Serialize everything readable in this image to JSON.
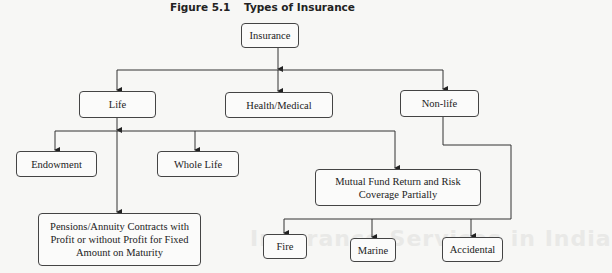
{
  "figure": {
    "number": "Figure 5.1",
    "title": "Types of Insurance"
  },
  "background_bleed_text": "Insurance Services in India",
  "nodes": {
    "root": "Insurance",
    "life": "Life",
    "health": "Health/Medical",
    "nonlife": "Non-life",
    "endowment": "Endowment",
    "whole_life": "Whole Life",
    "mutual_fund": "Mutual Fund Return and Risk Coverage Partially",
    "pensions": "Pensions/Annuity Contracts with Profit or without Profit for Fixed Amount on Maturity",
    "fire": "Fire",
    "marine": "Marine",
    "accidental": "Accidental"
  },
  "edges": [
    [
      "root",
      "life"
    ],
    [
      "root",
      "health"
    ],
    [
      "root",
      "nonlife"
    ],
    [
      "life",
      "endowment"
    ],
    [
      "life",
      "whole_life"
    ],
    [
      "life",
      "mutual_fund"
    ],
    [
      "life",
      "pensions"
    ],
    [
      "nonlife",
      "fire"
    ],
    [
      "nonlife",
      "marine"
    ],
    [
      "nonlife",
      "accidental"
    ]
  ],
  "colors": {
    "line": "#333333",
    "box_border": "#444444",
    "background": "#f7f7f5"
  }
}
